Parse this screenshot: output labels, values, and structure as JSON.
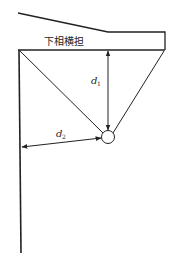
{
  "diagram": {
    "crossarm_label": "下相横担",
    "dimension_vertical": {
      "symbol": "d",
      "subscript": "1"
    },
    "dimension_horizontal": {
      "symbol": "d",
      "subscript": "2"
    },
    "colors": {
      "line": "#222222",
      "background": "#ffffff"
    }
  }
}
